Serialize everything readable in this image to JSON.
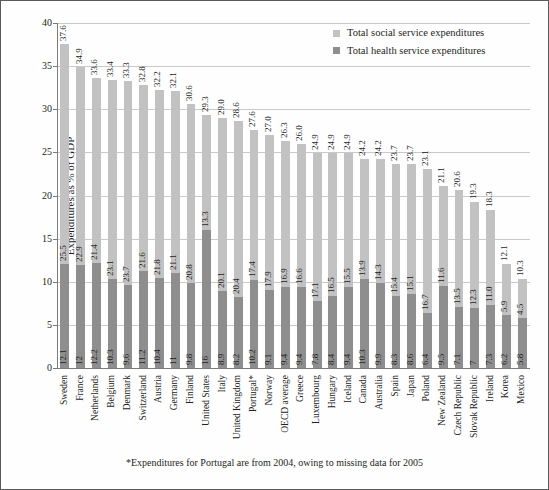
{
  "chart_data": {
    "type": "bar",
    "title": "",
    "xlabel": "",
    "ylabel": "Expenditures as % of GDP",
    "ylim": [
      0,
      40
    ],
    "yticks": [
      0,
      5,
      10,
      15,
      20,
      25,
      30,
      35,
      40
    ],
    "grid": true,
    "stacked": true,
    "legend_position": "top-right",
    "footnote": "*Expenditures for Portugal are from 2004, owing to missing data for 2005",
    "categories": [
      "Sweden",
      "France",
      "Netherlands",
      "Belgium",
      "Denmark",
      "Switzerland",
      "Austria",
      "Germany",
      "Finland",
      "United States",
      "Italy",
      "United Kingdom",
      "Portugal*",
      "Norway",
      "OECD average",
      "Greece",
      "Luxembourg",
      "Hungary",
      "Iceland",
      "Canada",
      "Australia",
      "Spain",
      "Japan",
      "Poland",
      "New Zealand",
      "Czech Republic",
      "Slovak Republic",
      "Ireland",
      "Korea",
      "Mexico"
    ],
    "series": [
      {
        "name": "Total social service expenditures",
        "color": "#c2c2c2",
        "values": [
          25.5,
          22.9,
          21.4,
          23.1,
          23.7,
          21.6,
          21.8,
          21.1,
          20.8,
          13.3,
          20.1,
          20.4,
          17.4,
          17.9,
          16.9,
          16.6,
          17.1,
          16.5,
          15.5,
          13.9,
          14.3,
          15.4,
          15.1,
          16.7,
          11.6,
          13.5,
          12.3,
          11.0,
          5.9,
          4.5
        ]
      },
      {
        "name": "Total health service expenditures",
        "color": "#8e8e8e",
        "values": [
          12.1,
          12,
          12.2,
          10.3,
          9.6,
          11.2,
          10.4,
          11,
          9.8,
          16,
          8.9,
          8.2,
          10.2,
          9.1,
          9.4,
          9.4,
          7.8,
          8.4,
          9.4,
          10.3,
          9.9,
          8.3,
          8.6,
          6.4,
          9.5,
          7.1,
          7,
          7.3,
          6.2,
          5.8
        ]
      }
    ],
    "totals": [
      37.6,
      34.9,
      33.6,
      33.4,
      33.3,
      32.8,
      32.2,
      32.1,
      30.6,
      29.3,
      29.0,
      28.6,
      27.6,
      27.0,
      26.3,
      26.0,
      24.9,
      24.9,
      24.9,
      24.2,
      24.2,
      23.7,
      23.7,
      23.1,
      21.1,
      20.6,
      19.3,
      18.3,
      12.1,
      10.3
    ],
    "social_labels": [
      "25.5",
      "22.9",
      "21.4",
      "23.1",
      "23.7",
      "21.6",
      "21.8",
      "21.1",
      "20.8",
      "13.3",
      "20.1",
      "20.4",
      "17.4",
      "17.9",
      "16.9",
      "16.6",
      "17.1",
      "16.5",
      "15.5",
      "13.9",
      "14.3",
      "15.4",
      "15.1",
      "16.7",
      "11.6",
      "13.5",
      "12.3",
      "11.0",
      "5.9",
      "4.5"
    ],
    "health_labels": [
      "12.1",
      "12",
      "12.2",
      "10.3",
      "9.6",
      "11.2",
      "10.4",
      "11",
      "9.8",
      "16",
      "8.9",
      "8.2",
      "10.2",
      "9.1",
      "9.4",
      "9.4",
      "7.8",
      "8.4",
      "9.4",
      "10.3",
      "9.9",
      "8.3",
      "8.6",
      "6.4",
      "9.5",
      "7.1",
      "7",
      "7.3",
      "6.2",
      "5.8"
    ],
    "total_labels": [
      "37.6",
      "34.9",
      "33.6",
      "33.4",
      "33.3",
      "32.8",
      "32.2",
      "32.1",
      "30.6",
      "29.3",
      "29.0",
      "28.6",
      "27.6",
      "27.0",
      "26.3",
      "26.0",
      "24.9",
      "24.9",
      "24.9",
      "24.2",
      "24.2",
      "23.7",
      "23.7",
      "23.1",
      "21.1",
      "20.6",
      "19.3",
      "18.3",
      "12.1",
      "10.3"
    ]
  },
  "legend": {
    "items": [
      {
        "label": "Total social service expenditures",
        "color": "#c2c2c2"
      },
      {
        "label": "Total health service expenditures",
        "color": "#8e8e8e"
      }
    ]
  },
  "axis": {
    "ylabel": "Expenditures as % of GDP",
    "ytick_labels": [
      "0",
      "5",
      "10",
      "15",
      "20",
      "25",
      "30",
      "35",
      "40"
    ]
  },
  "footnote": {
    "text": "*Expenditures for Portugal are from 2004, owing to missing data for 2005"
  }
}
